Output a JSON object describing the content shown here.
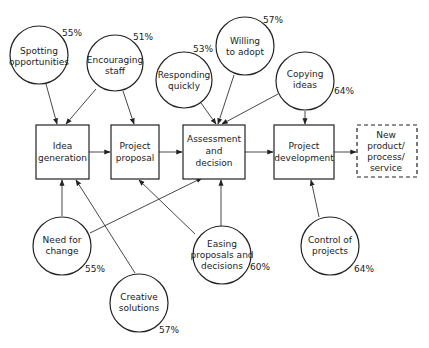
{
  "diagram": {
    "processes": [
      {
        "id": "idea",
        "lines": [
          "Idea",
          "generation"
        ]
      },
      {
        "id": "proposal",
        "lines": [
          "Project",
          "proposal"
        ]
      },
      {
        "id": "assessment",
        "lines": [
          "Assessment",
          "and",
          "decision"
        ]
      },
      {
        "id": "development",
        "lines": [
          "Project",
          "development"
        ]
      },
      {
        "id": "output",
        "lines": [
          "New",
          "product/",
          "process/",
          "service"
        ],
        "style": "dashed"
      }
    ],
    "factors": [
      {
        "id": "spotting",
        "lines": [
          "Spotting",
          "opportunities"
        ],
        "percent": "55%",
        "targets": [
          "idea"
        ]
      },
      {
        "id": "encouraging",
        "lines": [
          "Encouraging",
          "staff"
        ],
        "percent": "51%",
        "targets": [
          "idea",
          "proposal"
        ]
      },
      {
        "id": "responding",
        "lines": [
          "Responding",
          "quickly"
        ],
        "percent": "53%",
        "targets": [
          "assessment"
        ]
      },
      {
        "id": "willing",
        "lines": [
          "Willing",
          "to adopt"
        ],
        "percent": "57%",
        "targets": [
          "assessment"
        ]
      },
      {
        "id": "copying",
        "lines": [
          "Copying",
          "ideas"
        ],
        "percent": "64%",
        "targets": [
          "assessment",
          "development"
        ]
      },
      {
        "id": "need",
        "lines": [
          "Need for",
          "change"
        ],
        "percent": "55%",
        "targets": [
          "idea",
          "assessment"
        ]
      },
      {
        "id": "creative",
        "lines": [
          "Creative",
          "solutions"
        ],
        "percent": "57%",
        "targets": [
          "idea"
        ]
      },
      {
        "id": "easing",
        "lines": [
          "Easing",
          "proposals and",
          "decisions"
        ],
        "percent": "60%",
        "targets": [
          "proposal",
          "assessment"
        ]
      },
      {
        "id": "control",
        "lines": [
          "Control of",
          "projects"
        ],
        "percent": "64%",
        "targets": [
          "development"
        ]
      }
    ]
  }
}
